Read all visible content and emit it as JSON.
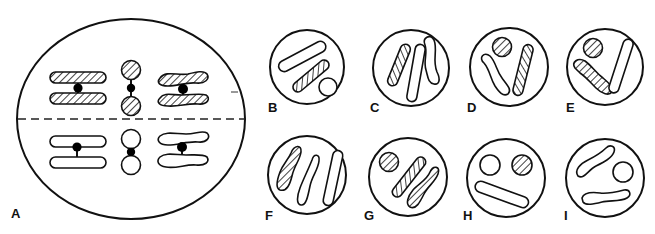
{
  "figure": {
    "colors": {
      "stroke": "#111111",
      "fill": "#ffffff",
      "centromere": "#000000",
      "hatch": "#111111"
    },
    "panels": [
      {
        "id": "A",
        "label": "A",
        "type": "cell-metaphase"
      },
      {
        "id": "B",
        "label": "B",
        "type": "gamete"
      },
      {
        "id": "C",
        "label": "C",
        "type": "gamete"
      },
      {
        "id": "D",
        "label": "D",
        "type": "gamete"
      },
      {
        "id": "E",
        "label": "E",
        "type": "gamete"
      },
      {
        "id": "F",
        "label": "F",
        "type": "gamete"
      },
      {
        "id": "G",
        "label": "G",
        "type": "gamete"
      },
      {
        "id": "H",
        "label": "H",
        "type": "gamete"
      },
      {
        "id": "I",
        "label": "I",
        "type": "gamete"
      }
    ]
  }
}
